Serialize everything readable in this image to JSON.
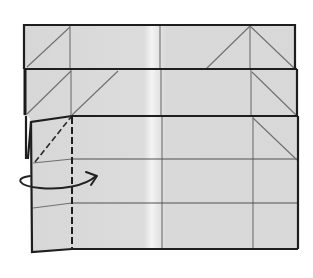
{
  "diagram": {
    "type": "origami-fold-step",
    "instruction_symbols": {
      "valley_fold_line": "dashed vertical line on left flap",
      "turn_over_arrow": "curved arrow indicating flip/turn"
    },
    "layers": [
      {
        "name": "top-strip",
        "creases": [
          "left-vertical",
          "center-vertical",
          "right-vertical",
          "left-diagonal",
          "right-peak-diagonals"
        ]
      },
      {
        "name": "middle-strip",
        "creases": [
          "left-vertical",
          "center-vertical",
          "right-vertical",
          "left-double-diagonal",
          "right-diagonal"
        ]
      },
      {
        "name": "bottom-panel",
        "creases": [
          "center-vertical",
          "right-vertical",
          "two-horizontal",
          "right-diagonal",
          "left-flap-valley-fold"
        ]
      }
    ],
    "colors": {
      "paper": "#d9d9d9",
      "paper_highlight": "#f2f2f2",
      "edge": "#1e1e1e",
      "crease": "#6f6f6f",
      "background": "#ffffff"
    }
  }
}
